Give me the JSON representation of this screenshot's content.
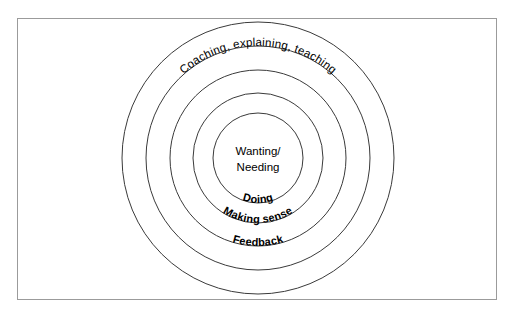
{
  "diagram": {
    "title_text": "",
    "geometry": {
      "center_x": 258,
      "center_y": 158,
      "radii": [
        136,
        112,
        88,
        65,
        45
      ]
    },
    "colors": {
      "circle_stroke": "#3a3a3a",
      "frame_border": "#9b9b9b",
      "background": "#ffffff",
      "text": "#000000"
    },
    "center": {
      "line1": "Wanting/",
      "line2": "Needing"
    },
    "rings": [
      {
        "id": "ring-outer",
        "label": "Coaching, explaining, teaching",
        "weight": "regular",
        "position": "top"
      },
      {
        "id": "ring-feedback",
        "label": "Feedback",
        "weight": "bold",
        "position": "bottom"
      },
      {
        "id": "ring-making-sense",
        "label": "Making sense",
        "weight": "bold",
        "position": "bottom"
      },
      {
        "id": "ring-doing",
        "label": "Doing",
        "weight": "bold",
        "position": "bottom"
      }
    ]
  }
}
